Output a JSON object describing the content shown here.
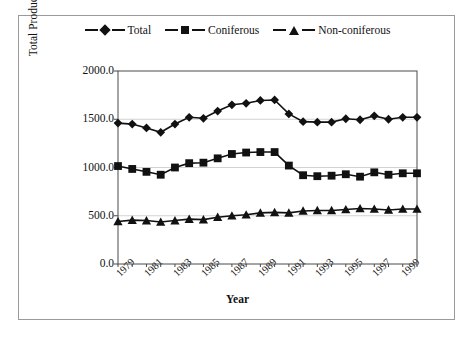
{
  "chart_data": {
    "type": "line",
    "title": "",
    "xlabel": "Year",
    "ylabel": "Total Production (Millions of Cubic Meters)",
    "ylim": [
      0,
      2000
    ],
    "yticks": [
      "0.0",
      "500.0",
      "1000.0",
      "1500.0",
      "2000.0"
    ],
    "ytick_values": [
      0,
      500,
      1000,
      1500,
      2000
    ],
    "grid": true,
    "legend_position": "top-center",
    "x": [
      1979,
      1980,
      1981,
      1982,
      1983,
      1984,
      1985,
      1986,
      1987,
      1988,
      1989,
      1990,
      1991,
      1992,
      1993,
      1994,
      1995,
      1996,
      1997,
      1998,
      1999,
      2000
    ],
    "xtick_labels": [
      "1979",
      "1981",
      "1983",
      "1985",
      "1987",
      "1989",
      "1991",
      "1993",
      "1995",
      "1997",
      "1999"
    ],
    "xtick_values": [
      1979,
      1981,
      1983,
      1985,
      1987,
      1989,
      1991,
      1993,
      1995,
      1997,
      1999
    ],
    "categories": [
      "1979",
      "1980",
      "1981",
      "1982",
      "1983",
      "1984",
      "1985",
      "1986",
      "1987",
      "1988",
      "1989",
      "1990",
      "1991",
      "1992",
      "1993",
      "1994",
      "1995",
      "1996",
      "1997",
      "1998",
      "1999",
      "2000"
    ],
    "series": [
      {
        "name": "Total",
        "marker": "diamond",
        "color": "#111111",
        "values": [
          1460,
          1450,
          1410,
          1365,
          1450,
          1520,
          1510,
          1585,
          1650,
          1665,
          1695,
          1700,
          1555,
          1475,
          1470,
          1470,
          1505,
          1495,
          1535,
          1500,
          1520,
          1520
        ]
      },
      {
        "name": "Coniferous",
        "marker": "square",
        "color": "#111111",
        "values": [
          1015,
          985,
          955,
          925,
          1000,
          1045,
          1050,
          1095,
          1140,
          1155,
          1160,
          1160,
          1020,
          920,
          910,
          915,
          930,
          905,
          950,
          925,
          940,
          940
        ]
      },
      {
        "name": "Non-coniferous",
        "marker": "triangle",
        "color": "#111111",
        "values": [
          440,
          455,
          450,
          435,
          450,
          465,
          460,
          485,
          500,
          510,
          530,
          535,
          530,
          550,
          555,
          555,
          565,
          575,
          570,
          560,
          570,
          570
        ]
      }
    ]
  }
}
